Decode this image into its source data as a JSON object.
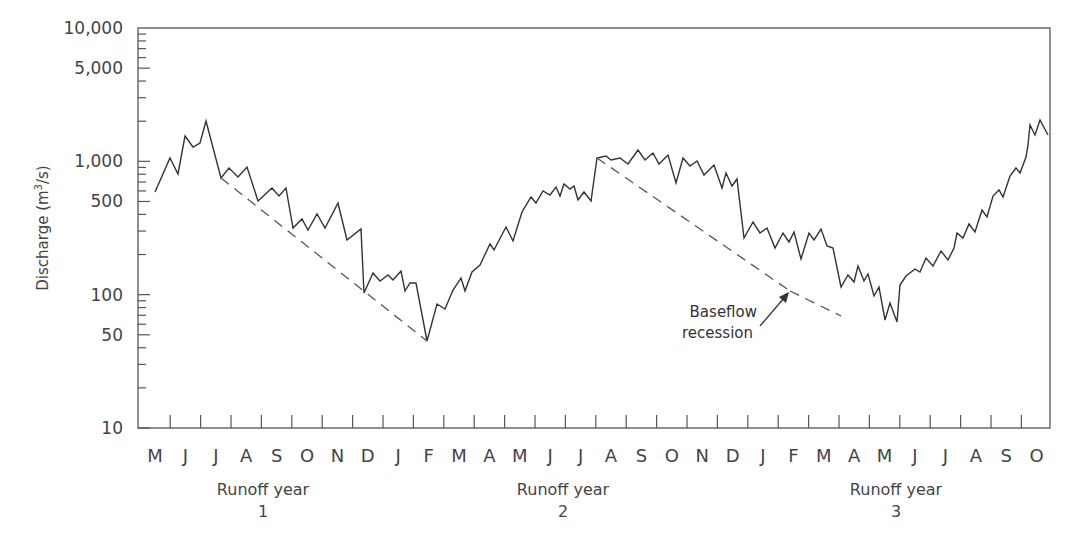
{
  "chart_data": {
    "type": "line",
    "title": "",
    "xlabel": "",
    "ylabel": "Discharge (m3/s)",
    "ylabel_display": {
      "text": "Discharge (m",
      "sup": "3",
      "tail": "/s)"
    },
    "yscale": "log",
    "ylim": [
      10,
      10000
    ],
    "yticks": [
      {
        "value": 10000,
        "label": "10,000"
      },
      {
        "value": 5000,
        "label": "5,000"
      },
      {
        "value": 1000,
        "label": "1,000"
      },
      {
        "value": 500,
        "label": "500"
      },
      {
        "value": 100,
        "label": "100"
      },
      {
        "value": 50,
        "label": "50"
      },
      {
        "value": 10,
        "label": "10"
      }
    ],
    "grid": false,
    "x_categories": [
      "M",
      "J",
      "J",
      "A",
      "S",
      "O",
      "N",
      "D",
      "J",
      "F",
      "M",
      "A",
      "M",
      "J",
      "J",
      "A",
      "S",
      "O",
      "N",
      "D",
      "J",
      "F",
      "M",
      "A",
      "M",
      "J",
      "J",
      "A",
      "S",
      "O"
    ],
    "runoff_years": [
      {
        "label": "Runoff year",
        "number": "1"
      },
      {
        "label": "Runoff year",
        "number": "2"
      },
      {
        "label": "Runoff year",
        "number": "3"
      }
    ],
    "annotations": [
      {
        "text_line1": "Baseflow",
        "text_line2": "recession",
        "target": "baseflow recession line (year 2-3 Feb)"
      }
    ],
    "series": [
      {
        "name": "Discharge hydrograph",
        "style": "solid",
        "approx_values_by_month_start": {
          "M1": 620,
          "J1": 1300,
          "J1b": 2000,
          "J1_end": 680,
          "A1": 900,
          "S1": 520,
          "O1": 260,
          "N1": 500,
          "D1": 100,
          "J2": 140,
          "F2": 48,
          "M2": 110,
          "A2": 250,
          "M3": 600,
          "J3": 1300,
          "J4": 1700,
          "J4_end": 1000,
          "A3": 1050,
          "S3": 950,
          "O3": 420,
          "N3": 450,
          "D3": 200,
          "J5": 300,
          "F5": 110,
          "M5": 85,
          "M5_end": 65,
          "A4": 150,
          "M6": 300,
          "J6": 900,
          "J7": 2800,
          "A5": 2800,
          "S5": 1700,
          "O5": 700,
          "O5_end": 620
        },
        "points_px": "155,192 170,158 178,174 185,136 193,147 200,143 206,121 221,178 229,168 238,177 247,167 258,201 272,188 279,196 286,188 293,228 302,219 308,230 317,214 325,228 338,203 347,240 361,229 364,293 373,273 380,281 388,275 393,280 401,271 405,291 410,283 416,283 427,341 437,304 445,309 453,290 461,278 465,291 472,272 480,265 490,244 494,250 506,227 513,241 522,212 531,197 536,203 543,191 550,195 556,187 560,196 564,184 570,189 574,186 578,200 584,192 591,201 597,158 606,156 611,160 620,158 628,164 638,150 645,160 653,153 659,164 668,155 676,183 683,158 690,166 697,161 704,175 714,165 722,188 726,173 732,186 737,179 744,238 753,222 760,233 767,228 775,248 783,233 789,242 794,232 801,259 809,233 814,240 821,229 827,246 833,248 841,287 848,275 854,282 858,266 864,281 868,274 874,296 879,287 885,320 890,303 897,322 900,285 906,276 915,269 920,272 926,258 933,266 941,251 948,260 954,248 957,233 963,238 969,224 975,232 982,210 987,217 993,196 999,190 1003,197 1010,176 1016,168 1020,173 1026,157 1028,145 1030,125 1035,135 1040,120 1048,135 1052,145 1058,138 1062,150 1068,155"
      },
      {
        "name": "Baseflow recession (dashed)",
        "style": "dashed",
        "segments_px": [
          "221,178 427,341",
          "597,158 790,291",
          "790,291 841,316"
        ]
      }
    ]
  },
  "labels": {
    "annotation_line1": "Baseflow",
    "annotation_line2": "recession"
  }
}
